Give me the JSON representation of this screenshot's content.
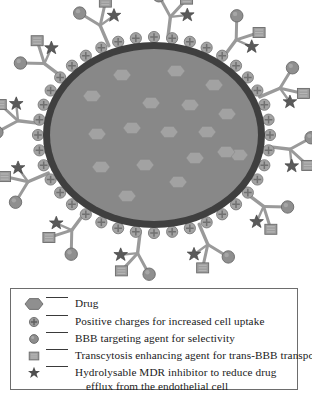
{
  "figure": {
    "colors": {
      "core_fill": "#888888",
      "core_ring": "#3f3f3f",
      "drug_hexagon": "#a0a0a0",
      "ligand_stem": "#9a9a9a",
      "ligand_stem_edge": "#6f6f6f",
      "circle_tip": "#8f8f8f",
      "square_tip": "#9d9d9d",
      "star": "#5a5a5a",
      "charge_circle": "#a3a3a3",
      "legend_border": "#6d6d6d",
      "text": "#1a1a1a"
    },
    "core": {
      "cx": 154,
      "cy": 135,
      "rx": 111,
      "ry": 93,
      "ring_width": 7
    },
    "drug_hexagons": [
      {
        "x": 122,
        "y": 75
      },
      {
        "x": 176,
        "y": 71
      },
      {
        "x": 92,
        "y": 96
      },
      {
        "x": 151,
        "y": 103
      },
      {
        "x": 214,
        "y": 85
      },
      {
        "x": 190,
        "y": 105
      },
      {
        "x": 227,
        "y": 114
      },
      {
        "x": 97,
        "y": 134
      },
      {
        "x": 132,
        "y": 128
      },
      {
        "x": 169,
        "y": 132
      },
      {
        "x": 239,
        "y": 155
      },
      {
        "x": 101,
        "y": 167
      },
      {
        "x": 145,
        "y": 165
      },
      {
        "x": 195,
        "y": 158
      },
      {
        "x": 226,
        "y": 152
      },
      {
        "x": 178,
        "y": 182
      },
      {
        "x": 127,
        "y": 196
      },
      {
        "x": 207,
        "y": 132
      }
    ],
    "charge_circle_count": 40,
    "ligand_branch_count": 12,
    "branch_tips": [
      "circle-tip",
      "square-tip",
      "star-tip"
    ]
  },
  "legend": {
    "items": [
      {
        "marker": "hexagon-marker",
        "label": "Drug"
      },
      {
        "marker": "cross-circle-marker",
        "label": "Positive charges for increased cell uptake"
      },
      {
        "marker": "circle-marker",
        "label": "BBB targeting agent for selectivity"
      },
      {
        "marker": "square-marker",
        "label": "Transcytosis enhancing agent for trans-BBB transport"
      },
      {
        "marker": "star-marker",
        "label": "Hydrolysable MDR inhibitor to reduce drug"
      }
    ],
    "continuation_line": "efflux from the endothelial cell"
  }
}
